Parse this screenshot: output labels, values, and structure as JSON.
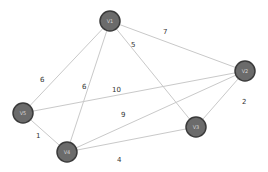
{
  "graph": {
    "type": "weighted-undirected-graph",
    "colors": {
      "node_fill": "#6b6b6b",
      "node_stroke": "#3a3a3a",
      "node_label": "#d8d8d8",
      "edge": "#c9c9c9",
      "weight_text": "#333333",
      "background": "#ffffff"
    },
    "nodes": [
      {
        "id": "V1",
        "label": "V1",
        "x": 110,
        "y": 21
      },
      {
        "id": "V2",
        "label": "V2",
        "x": 245,
        "y": 71
      },
      {
        "id": "V3",
        "label": "V3",
        "x": 196,
        "y": 127
      },
      {
        "id": "V4",
        "label": "V4",
        "x": 67,
        "y": 152
      },
      {
        "id": "V5",
        "label": "V5",
        "x": 23,
        "y": 113
      }
    ],
    "edges": [
      {
        "from": "V1",
        "to": "V2",
        "weight": "7",
        "lx": 163,
        "ly": 34
      },
      {
        "from": "V1",
        "to": "V3",
        "weight": "5",
        "lx": 131,
        "ly": 47
      },
      {
        "from": "V1",
        "to": "V5",
        "weight": "6",
        "lx": 40,
        "ly": 82
      },
      {
        "from": "V1",
        "to": "V4",
        "weight": "6",
        "lx": 82,
        "ly": 89
      },
      {
        "from": "V5",
        "to": "V2",
        "weight": "10",
        "lx": 112,
        "ly": 92
      },
      {
        "from": "V5",
        "to": "V4",
        "weight": "1",
        "lx": 36,
        "ly": 138
      },
      {
        "from": "V4",
        "to": "V2",
        "weight": "9",
        "lx": 121,
        "ly": 117
      },
      {
        "from": "V4",
        "to": "V3",
        "weight": "4",
        "lx": 117,
        "ly": 162
      },
      {
        "from": "V3",
        "to": "V2",
        "weight": "2",
        "lx": 242,
        "ly": 104
      }
    ]
  }
}
